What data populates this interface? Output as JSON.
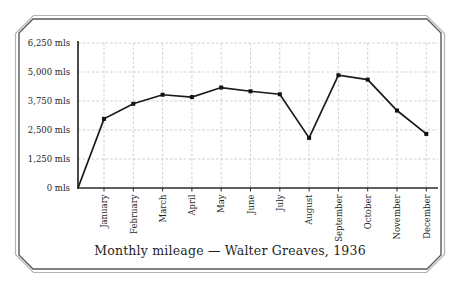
{
  "colors": {
    "background": "#ffffff",
    "line": "#1a1a1a",
    "marker": "#111111",
    "grid": "#c9c9c9",
    "axis": "#2b2b2b",
    "text": "#1f1f1f",
    "frame_outer": "#b3b3b3",
    "frame_inner": "#585858"
  },
  "chart_data": {
    "type": "line",
    "title": "Monthly mileage — Walter Greaves, 1936",
    "categories": [
      "January",
      "February",
      "March",
      "April",
      "May",
      "June",
      "July",
      "August",
      "September",
      "October",
      "November",
      "December"
    ],
    "values": [
      2980,
      3630,
      4020,
      3920,
      4330,
      4170,
      4040,
      2160,
      4860,
      4670,
      3340,
      2330
    ],
    "unit": "mls",
    "starts_at_origin": true,
    "ytick_values": [
      0,
      1250,
      2500,
      3750,
      5000,
      6250
    ],
    "ytick_labels": [
      "0 mls",
      "1,250 mls",
      "2,500 mls",
      "3,750 mls",
      "5,000 mls",
      "6,250 mls"
    ],
    "ylim": [
      0,
      6250
    ],
    "grid": "dashed light gray, both axes",
    "legend": "none",
    "marker": "square",
    "xlabel": "",
    "ylabel": ""
  }
}
